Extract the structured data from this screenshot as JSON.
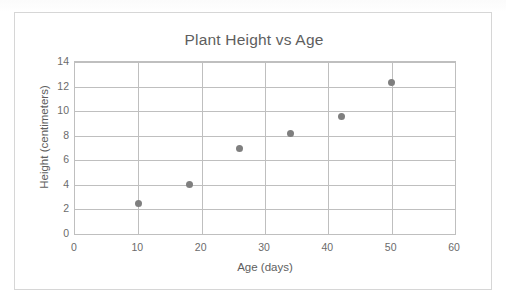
{
  "chart_data": {
    "type": "scatter",
    "title": "Plant Height vs Age",
    "xlabel": "Age (days)",
    "ylabel": "Height (centimeters)",
    "xlim": [
      0,
      60
    ],
    "ylim": [
      0,
      14
    ],
    "xticks": [
      0,
      10,
      20,
      30,
      40,
      50,
      60
    ],
    "yticks": [
      0,
      2,
      4,
      6,
      8,
      10,
      12,
      14
    ],
    "xtick_labels": [
      "0",
      "10",
      "20",
      "30",
      "40",
      "50",
      "60"
    ],
    "ytick_labels": [
      "0",
      "2",
      "4",
      "6",
      "8",
      "10",
      "12",
      "14"
    ],
    "grid": "both",
    "legend": "none",
    "x": [
      10,
      18,
      26,
      34,
      42,
      50
    ],
    "y": [
      2.5,
      4.0,
      7.0,
      8.2,
      9.6,
      12.3
    ],
    "points": [
      {
        "x": 10,
        "y": 2.5
      },
      {
        "x": 18,
        "y": 4.0
      },
      {
        "x": 26,
        "y": 7.0
      },
      {
        "x": 34,
        "y": 8.2
      },
      {
        "x": 42,
        "y": 9.6
      },
      {
        "x": 50,
        "y": 12.3
      }
    ],
    "marker_color": "#7f7f7f",
    "gridline_color": "#bfbfbf",
    "plot_background": "#ffffff",
    "frame_border_color": "#d6d6d6",
    "text_color": "#5e5e5e"
  }
}
